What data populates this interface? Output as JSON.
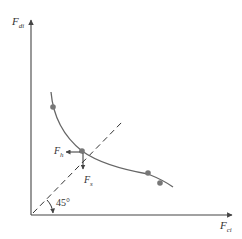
{
  "diagram": {
    "axes": {
      "y_label": "F",
      "y_label_sub": "di",
      "x_label": "F",
      "x_label_sub": "ci"
    },
    "angle_label": "45°",
    "force_labels": {
      "horizontal": "F",
      "horizontal_sub": "h",
      "vertical": "F",
      "vertical_sub": "s"
    },
    "colors": {
      "axis": "#444444",
      "curve": "#666666",
      "point": "#777777",
      "dashed": "#333333"
    },
    "curve_points": [
      {
        "x": 53,
        "y": 107
      },
      {
        "x": 82,
        "y": 151
      },
      {
        "x": 148,
        "y": 173
      },
      {
        "x": 160,
        "y": 183
      }
    ]
  }
}
